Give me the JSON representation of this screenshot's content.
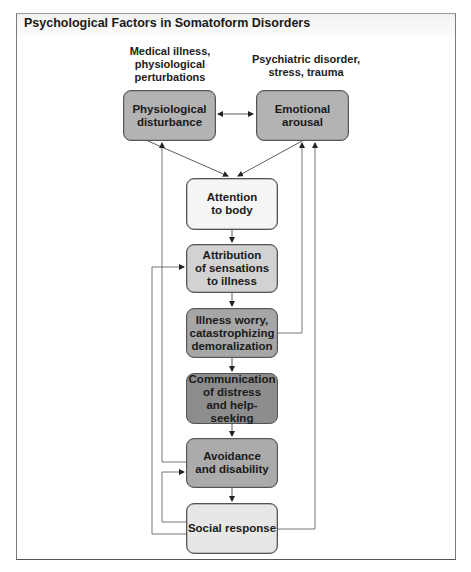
{
  "title": "Psychological Factors in Somatoform Disorders",
  "sources": {
    "medical": "Medical illness,\nphysiological\nperturbations",
    "psychiatric": "Psychiatric disorder,\nstress, trauma"
  },
  "nodes": {
    "physiological": {
      "label": "Physiological\ndisturbance",
      "color": "#b3b3b3"
    },
    "emotional": {
      "label": "Emotional\narousal",
      "color": "#b3b3b3"
    },
    "attention": {
      "label": "Attention\nto body",
      "color": "#f5f5f5"
    },
    "attribution": {
      "label": "Attribution\nof sensations\nto illness",
      "color": "#d2d2d2"
    },
    "worry": {
      "label": "Illness worry,\ncatastrophizing\ndemoralization",
      "color": "#a6a6a6"
    },
    "communication": {
      "label": "Communication\nof distress\nand help-seeking",
      "color": "#8d8d8d"
    },
    "avoidance": {
      "label": "Avoidance\nand disability",
      "color": "#ababab"
    },
    "social": {
      "label": "Social response",
      "color": "#e7e7e7"
    }
  },
  "edges": [
    {
      "from": "physiological",
      "to": "emotional",
      "type": "bidirectional"
    },
    {
      "from": "physiological",
      "to": "attention"
    },
    {
      "from": "emotional",
      "to": "attention"
    },
    {
      "from": "attention",
      "to": "attribution"
    },
    {
      "from": "attribution",
      "to": "worry"
    },
    {
      "from": "worry",
      "to": "communication"
    },
    {
      "from": "communication",
      "to": "avoidance"
    },
    {
      "from": "avoidance",
      "to": "social"
    },
    {
      "from": "worry",
      "to": "emotional"
    },
    {
      "from": "social",
      "to": "emotional"
    },
    {
      "from": "avoidance",
      "to": "physiological"
    },
    {
      "from": "social",
      "to": "attribution"
    },
    {
      "from": "social",
      "to": "avoidance"
    }
  ]
}
